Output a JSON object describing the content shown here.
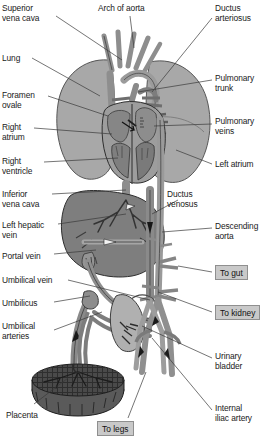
{
  "palette": {
    "background": "#ffffff",
    "outline": "#2b2b2b",
    "lung": "#a8a8a8",
    "lung_dark": "#9a9a9a",
    "vessel_mid": "#8e8e8e",
    "vessel_dark": "#6e6e6e",
    "vessel_light": "#b4b4b4",
    "liver": "#7e7e7e",
    "heart": "#9d9d9d",
    "heart_dark": "#787878",
    "placenta": "#4a4a4a",
    "bladder": "#b0b0b0",
    "box_fill": "#c9c9c9",
    "box_border": "#8f8f8f",
    "leader": "#3a3a3a",
    "text": "#1a1a1a"
  },
  "labels_left": [
    {
      "id": "superior-vena-cava",
      "text": "Superior\nvena cava",
      "x": 2,
      "y": 4
    },
    {
      "id": "lung",
      "text": "Lung",
      "x": 2,
      "y": 54
    },
    {
      "id": "foramen-ovale",
      "text": "Foramen\novale",
      "x": 2,
      "y": 91
    },
    {
      "id": "right-atrium",
      "text": "Right\natrium",
      "x": 2,
      "y": 123
    },
    {
      "id": "right-ventricle",
      "text": "Right\nventricle",
      "x": 2,
      "y": 157
    },
    {
      "id": "inferior-vena-cava",
      "text": "Inferior\nvena cava",
      "x": 2,
      "y": 190
    },
    {
      "id": "left-hepatic-vein",
      "text": "Left hepatic\nvein",
      "x": 2,
      "y": 221
    },
    {
      "id": "portal-vein",
      "text": "Portal vein",
      "x": 2,
      "y": 252
    },
    {
      "id": "umbilical-vein",
      "text": "Umbilical vein",
      "x": 2,
      "y": 276
    },
    {
      "id": "umbilicus",
      "text": "Umbilicus",
      "x": 2,
      "y": 299
    },
    {
      "id": "umbilical-arteries",
      "text": "Umbilical\narteries",
      "x": 2,
      "y": 322
    },
    {
      "id": "placenta",
      "text": "Placenta",
      "x": 6,
      "y": 411
    }
  ],
  "labels_right": [
    {
      "id": "arch-of-aorta",
      "text": "Arch of aorta",
      "x": 98,
      "y": 4
    },
    {
      "id": "ductus-arteriosus",
      "text": "Ductus\narteriosus",
      "x": 215,
      "y": 4
    },
    {
      "id": "pulmonary-trunk",
      "text": "Pulmonary\ntrunk",
      "x": 215,
      "y": 74
    },
    {
      "id": "pulmonary-veins",
      "text": "Pulmonary\nveins",
      "x": 215,
      "y": 117
    },
    {
      "id": "left-atrium",
      "text": "Left atrium",
      "x": 215,
      "y": 160
    },
    {
      "id": "ductus-venosus",
      "text": "Ductus\nvenosus",
      "x": 167,
      "y": 190
    },
    {
      "id": "descending-aorta",
      "text": "Descending\naorta",
      "x": 215,
      "y": 222
    },
    {
      "id": "urinary-bladder",
      "text": "Urinary\nbladder",
      "x": 215,
      "y": 352
    },
    {
      "id": "internal-iliac-artery",
      "text": "Internal\niliac artery",
      "x": 215,
      "y": 404
    }
  ],
  "boxed_labels": [
    {
      "id": "to-gut",
      "text": "To gut",
      "x": 215,
      "y": 265
    },
    {
      "id": "to-kidney",
      "text": "To kidney",
      "x": 215,
      "y": 305
    },
    {
      "id": "to-legs",
      "text": "To legs",
      "x": 97,
      "y": 421
    }
  ]
}
